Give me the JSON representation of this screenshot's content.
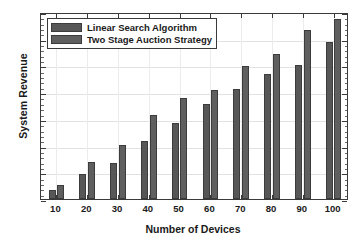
{
  "chart_data": {
    "type": "bar",
    "title": "",
    "xlabel": "Number of Devices",
    "ylabel": "System Revenue",
    "categories": [
      "10",
      "20",
      "30",
      "40",
      "50",
      "60",
      "70",
      "80",
      "90",
      "100"
    ],
    "series": [
      {
        "name": "Linear Search Algorithm",
        "color": "#575757",
        "values": [
          35,
          92,
          133,
          218,
          283,
          357,
          412,
          468,
          500,
          588
        ]
      },
      {
        "name": "Two Stage Auction Strategy",
        "color": "#5f5f5f",
        "values": [
          52,
          137,
          204,
          313,
          379,
          408,
          498,
          541,
          632,
          672
        ]
      }
    ],
    "ylim": [
      0,
      700
    ],
    "ytick_labels": [
      "0",
      "100",
      "200",
      "300",
      "400",
      "500",
      "600",
      "700"
    ],
    "ytick_values": [
      0,
      100,
      200,
      300,
      400,
      500,
      600,
      700
    ],
    "grid": true,
    "legend_position": "top-left"
  }
}
